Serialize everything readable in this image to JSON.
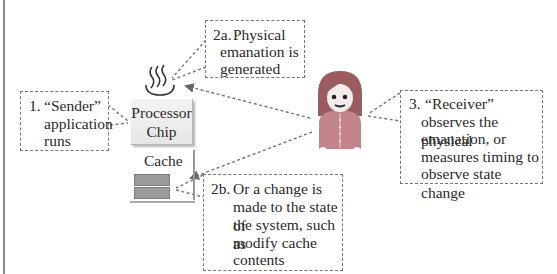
{
  "diagram": {
    "nodes": {
      "processor": {
        "label_line1": "Processor",
        "label_line2": "Chip"
      },
      "cache": {
        "label": "Cache",
        "blocks": 2
      },
      "heat_icon": "heat-emanation-icon",
      "receiver_icon": "person-avatar-icon"
    },
    "notes": [
      {
        "id": "sender",
        "number": "1.",
        "lines": [
          "“Sender”",
          "application",
          "runs"
        ]
      },
      {
        "id": "emanation",
        "number": "2a.",
        "lines": [
          "Physical",
          "emanation is",
          "generated"
        ]
      },
      {
        "id": "state-change",
        "number": "2b.",
        "lines": [
          "Or a change is",
          "made to the state of",
          "the system, such as",
          "modify cache",
          "contents"
        ]
      },
      {
        "id": "receiver",
        "number": "3.",
        "lines": [
          "“Receiver”",
          "observes the physical",
          "emanation, or",
          "measures timing to",
          "observe state change"
        ]
      }
    ],
    "edges": [
      {
        "from": "sender-note",
        "to": "processor-chip"
      },
      {
        "from": "emanation-note",
        "to": "heat-icon"
      },
      {
        "from": "receiver",
        "to": "heat-icon"
      },
      {
        "from": "receiver",
        "to": "cache"
      },
      {
        "from": "state-change-note",
        "to": "cache-block"
      },
      {
        "from": "receiver-note",
        "to": "receiver"
      }
    ],
    "colors": {
      "dash": "#777777",
      "person_body": "#c2848a",
      "person_hair": "#9b5c5f",
      "cache_block": "#9c9c9c"
    }
  }
}
